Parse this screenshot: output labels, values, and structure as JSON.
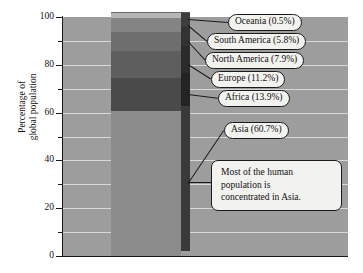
{
  "chart_data": {
    "type": "bar",
    "subtype": "stacked-3d-single-column",
    "title": "",
    "subtitle": "",
    "xlabel": "",
    "ylabel": "Percentage of global population",
    "ylabel_lines": [
      "Percentage of",
      "global population"
    ],
    "ylim": [
      0,
      100
    ],
    "grid": true,
    "grid_interval": 10,
    "legend_position": "callout-labels-right",
    "categories": [
      "Asia",
      "Africa",
      "Europe",
      "North America",
      "South America",
      "Oceania"
    ],
    "values": [
      60.7,
      13.9,
      11.2,
      7.9,
      5.8,
      0.5
    ],
    "tick_labels": [
      "0",
      "20",
      "40",
      "60",
      "80",
      "100"
    ],
    "tick_values": [
      0,
      20,
      40,
      60,
      80,
      100
    ],
    "minor_tick_values": [
      10,
      30,
      50,
      70,
      90
    ],
    "segments": [
      {
        "label": "Asia (60.7%)",
        "name": "Asia",
        "value": 60.7,
        "color": "#8c8c8c",
        "side_color": "#3a3a3a",
        "start": 0.0,
        "end": 60.7
      },
      {
        "label": "Africa (13.9%)",
        "name": "Africa",
        "value": 13.9,
        "color": "#4a4a4a",
        "side_color": "#232323",
        "start": 60.7,
        "end": 74.6
      },
      {
        "label": "Europe (11.2%)",
        "name": "Europe",
        "value": 11.2,
        "color": "#5e5e5e",
        "side_color": "#2b2b2b",
        "start": 74.6,
        "end": 85.8
      },
      {
        "label": "North America (7.9%)",
        "name": "North America",
        "value": 7.9,
        "color": "#6e6e6e",
        "side_color": "#323232",
        "start": 85.8,
        "end": 93.7
      },
      {
        "label": "South America (5.8%)",
        "name": "South America",
        "value": 5.8,
        "color": "#848484",
        "side_color": "#3c3c3c",
        "start": 93.7,
        "end": 99.5
      },
      {
        "label": "Oceania (0.5%)",
        "name": "Oceania",
        "value": 0.5,
        "color": "#b8b8b8",
        "side_color": "#565656",
        "start": 99.5,
        "end": 100.0
      }
    ],
    "annotations": [
      {
        "name": "asia-note",
        "text": "Most of the human population is concentrated in Asia.",
        "lines": [
          "Most of the human",
          "population is",
          "concentrated in Asia."
        ],
        "points_to_value": 31
      }
    ],
    "colors": {
      "plot_background": "#9d9d9d",
      "gridline": "#d8d8d8",
      "axis": "#1a1a1a",
      "callout_background": "#f2f2ef",
      "callout_border": "#1b1b1b",
      "text": "#111111"
    }
  }
}
